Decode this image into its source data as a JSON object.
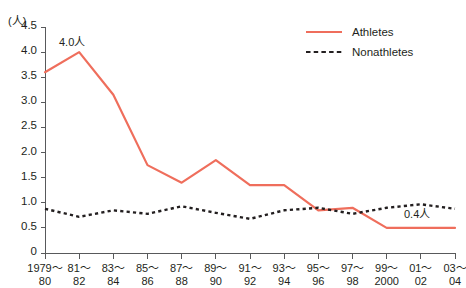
{
  "chart_data": {
    "type": "line",
    "title": "",
    "xlabel": "",
    "ylabel": "",
    "unit_label": "(人)",
    "ylim": [
      0,
      4.5
    ],
    "ytick_values": [
      0,
      0.5,
      1.0,
      1.5,
      2.0,
      2.5,
      3.0,
      3.5,
      4.0,
      4.5
    ],
    "ytick_labels": [
      "0",
      "0.5",
      "1.0",
      "1.5",
      "2.0",
      "2.5",
      "3.0",
      "3.5",
      "4.0",
      "4.5"
    ],
    "grid": false,
    "legend_position": "top-right",
    "categories": [
      "1979~80",
      "81~82",
      "83~84",
      "85~86",
      "87~88",
      "89~90",
      "91~92",
      "93~94",
      "95~96",
      "97~98",
      "99~2000",
      "01~02",
      "03~04"
    ],
    "category_lines": [
      [
        "1979～",
        "80"
      ],
      [
        "81～",
        "82"
      ],
      [
        "83～",
        "84"
      ],
      [
        "85～",
        "86"
      ],
      [
        "87～",
        "88"
      ],
      [
        "89～",
        "90"
      ],
      [
        "91～",
        "92"
      ],
      [
        "93～",
        "94"
      ],
      [
        "95～",
        "96"
      ],
      [
        "97～",
        "98"
      ],
      [
        "99～",
        "2000"
      ],
      [
        "01～",
        "02"
      ],
      [
        "03～",
        "04"
      ]
    ],
    "series": [
      {
        "name": "Athletes",
        "color": "#ef6e5c",
        "style": "solid",
        "values": [
          3.6,
          4.0,
          3.15,
          1.75,
          1.4,
          1.85,
          1.35,
          1.35,
          0.85,
          0.9,
          0.5,
          0.5,
          0.5
        ]
      },
      {
        "name": "Nonathletes",
        "color": "#231f20",
        "style": "dotted",
        "values": [
          0.88,
          0.72,
          0.85,
          0.78,
          0.93,
          0.8,
          0.68,
          0.85,
          0.9,
          0.78,
          0.9,
          0.97,
          0.88
        ]
      }
    ],
    "annotations": [
      {
        "text": "4.0人",
        "series": "Athletes",
        "category_index": 1,
        "value": 4.0
      },
      {
        "text": "0.4人",
        "series": "Athletes",
        "category_index": 12,
        "value": 0.5
      }
    ]
  },
  "legend": {
    "items": [
      {
        "label": "Athletes"
      },
      {
        "label": "Nonathletes"
      }
    ]
  }
}
